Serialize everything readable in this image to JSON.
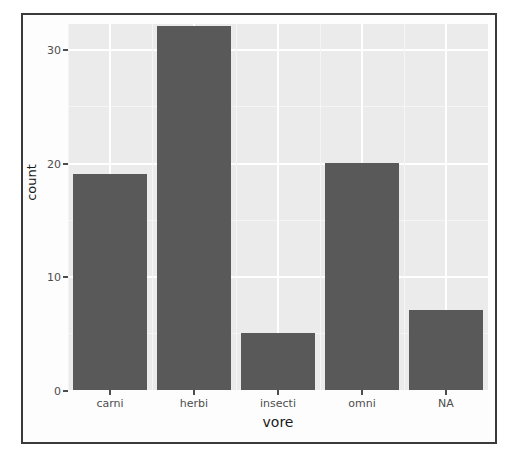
{
  "chart_data": {
    "type": "bar",
    "title": "",
    "subtitle": "",
    "xlabel": "vore",
    "ylabel": "count",
    "categories": [
      "carni",
      "herbi",
      "insecti",
      "omni",
      "NA"
    ],
    "values": [
      19,
      32,
      5,
      20,
      7
    ],
    "series": [
      {
        "name": "count",
        "values": [
          19,
          32,
          5,
          20,
          7
        ]
      }
    ],
    "ylim": [
      0,
      32
    ],
    "y_ticks": [
      0,
      10,
      20,
      30
    ],
    "y_tick_labels": [
      "0",
      "10",
      "20",
      "30"
    ],
    "y_minor_ticks": [
      5,
      15,
      25
    ],
    "x_tick_labels": [
      "carni",
      "herbi",
      "insecti",
      "omni",
      "NA"
    ],
    "grid": true,
    "legend": "none",
    "legend_position": "none",
    "annotations": [],
    "colors": {
      "bar_fill": "#595959",
      "panel_background": "#ebebeb",
      "grid_major": "#ffffff",
      "grid_minor": "#f5f5f5",
      "axis_text": "#4d4d4d",
      "axis_title": "#1a1a1a",
      "plot_background": "#fdfdfd",
      "frame_border": "#3a3a3c"
    }
  }
}
